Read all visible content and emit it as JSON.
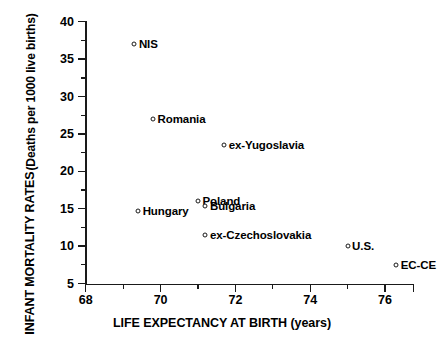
{
  "chart_data": {
    "type": "scatter",
    "title": "",
    "xlabel": "LIFE EXPECTANCY AT BIRTH (years)",
    "ylabel_line1": "INFANT MORTALITY RATES",
    "ylabel_line2": "(Deaths per 1000 live births)",
    "xlim": [
      68,
      76.8
    ],
    "ylim": [
      5,
      40
    ],
    "xticks": [
      68,
      70,
      72,
      74,
      76
    ],
    "xtick_labels": [
      "68",
      "70",
      "72",
      "74",
      "76"
    ],
    "x_minor_ticks": [
      69,
      71,
      73,
      75
    ],
    "yticks": [
      5,
      10,
      15,
      20,
      25,
      30,
      35,
      40
    ],
    "ytick_labels": [
      "5",
      "10",
      "15",
      "20",
      "25",
      "30",
      "35",
      "40"
    ],
    "y_minor_ticks": [
      7.5,
      12.5,
      17.5,
      22.5,
      27.5,
      32.5,
      37.5
    ],
    "grid": false,
    "legend": "none",
    "marker": "open-circle",
    "points": [
      {
        "label": "NIS",
        "x": 69.3,
        "y": 37.0
      },
      {
        "label": "Romania",
        "x": 69.8,
        "y": 27.0
      },
      {
        "label": "ex-Yugoslavia",
        "x": 71.7,
        "y": 23.5
      },
      {
        "label": "Poland",
        "x": 71.0,
        "y": 16.0
      },
      {
        "label": "Bulgaria",
        "x": 71.2,
        "y": 15.4
      },
      {
        "label": "Hungary",
        "x": 69.4,
        "y": 14.7
      },
      {
        "label": "ex-Czechoslovakia",
        "x": 71.2,
        "y": 11.5
      },
      {
        "label": "U.S.",
        "x": 75.0,
        "y": 10.0
      },
      {
        "label": "EC-CE",
        "x": 76.3,
        "y": 7.5
      }
    ]
  },
  "colors": {
    "ink": "#1a1a1a",
    "background": "#ffffff"
  }
}
